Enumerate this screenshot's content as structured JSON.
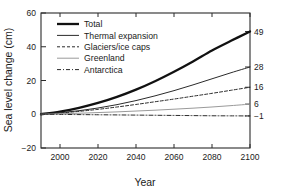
{
  "chart_data": {
    "type": "line",
    "title": "",
    "xlabel": "Year",
    "ylabel": "Sea level change (cm)",
    "xlim": [
      1990,
      2100
    ],
    "ylim": [
      -20,
      60
    ],
    "xticks": [
      "2000",
      "2020",
      "2040",
      "2060",
      "2080",
      "2100"
    ],
    "xtick_values": [
      2000,
      2020,
      2040,
      2060,
      2080,
      2100
    ],
    "yticks": [
      "60",
      "40",
      "20",
      "0",
      "-20"
    ],
    "ytick_values": [
      60,
      40,
      20,
      0,
      -20
    ],
    "grid": false,
    "legend_position": "upper left",
    "right_axis_labels": [
      "49",
      "28",
      "16",
      "6",
      "-1"
    ],
    "right_axis_values": [
      49,
      28,
      16,
      6,
      -1
    ],
    "x": [
      1990,
      2000,
      2010,
      2020,
      2030,
      2040,
      2050,
      2060,
      2070,
      2080,
      2090,
      2100
    ],
    "series": [
      {
        "name": "Total",
        "style": "solid-thick",
        "color": "#111111",
        "end_label": "49",
        "values": [
          0,
          1.6,
          3.8,
          6.7,
          10.3,
          14.6,
          19.6,
          25.2,
          31.3,
          37.8,
          43.5,
          49
        ]
      },
      {
        "name": "Thermal expansion",
        "style": "solid-thin",
        "color": "#2b2b2b",
        "end_label": "28",
        "values": [
          0,
          0.9,
          2.1,
          3.7,
          5.7,
          8.1,
          10.9,
          14.0,
          17.4,
          21.0,
          24.6,
          28
        ]
      },
      {
        "name": "Glaciers/ice caps",
        "style": "dashed",
        "color": "#2b2b2b",
        "end_label": "16",
        "values": [
          0,
          0.7,
          1.7,
          2.9,
          4.3,
          5.8,
          7.4,
          9.0,
          10.7,
          12.4,
          14.2,
          16
        ]
      },
      {
        "name": "Greenland",
        "style": "solid-light",
        "color": "#9a9a9a",
        "end_label": "6",
        "values": [
          0,
          0.3,
          0.6,
          1.0,
          1.4,
          1.9,
          2.4,
          3.0,
          3.6,
          4.3,
          5.1,
          6
        ]
      },
      {
        "name": "Antarctica",
        "style": "dashdot",
        "color": "#2b2b2b",
        "end_label": "-1",
        "values": [
          0,
          -0.1,
          -0.2,
          -0.3,
          -0.4,
          -0.5,
          -0.6,
          -0.7,
          -0.8,
          -0.9,
          -0.95,
          -1
        ]
      }
    ]
  }
}
